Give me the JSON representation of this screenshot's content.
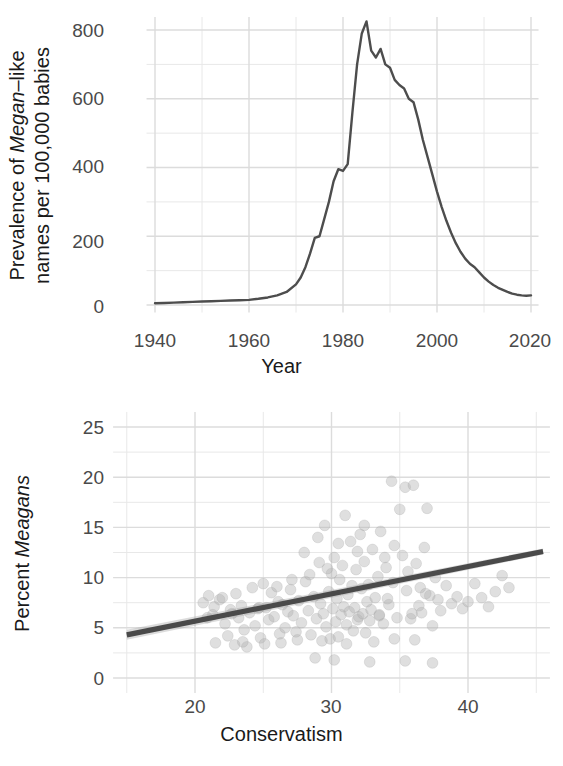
{
  "figure": {
    "background": "#ffffff",
    "grid_color": "#e8e8e8",
    "data_color": "#4d4d4d",
    "point_color": "#b3b3b3"
  },
  "chart_data": [
    {
      "type": "line",
      "panel": "top",
      "title": "",
      "xlabel": "Year",
      "ylabel": "Prevalence of Megan-like names per 100,000 babies",
      "ylabel_line1_pre": "Prevalence of ",
      "ylabel_line1_ital": "Megan",
      "ylabel_line1_post": "–like",
      "ylabel_line2": "names per 100,000 babies",
      "xlim": [
        1938,
        2022
      ],
      "ylim": [
        -20,
        840
      ],
      "xticks": [
        1940,
        1960,
        1980,
        2000,
        2020
      ],
      "xtick_labels": [
        "1940",
        "1960",
        "1980",
        "2000",
        "2020"
      ],
      "yticks": [
        0,
        200,
        400,
        600,
        800
      ],
      "ytick_labels": [
        "0",
        "200",
        "400",
        "600",
        "800"
      ],
      "grid": true,
      "minor_grid": true,
      "x": [
        1940,
        1942,
        1944,
        1946,
        1948,
        1950,
        1952,
        1954,
        1956,
        1958,
        1960,
        1962,
        1964,
        1966,
        1968,
        1970,
        1971,
        1972,
        1973,
        1974,
        1975,
        1976,
        1977,
        1978,
        1979,
        1980,
        1981,
        1982,
        1983,
        1984,
        1985,
        1986,
        1987,
        1988,
        1989,
        1990,
        1991,
        1992,
        1993,
        1994,
        1995,
        1996,
        1997,
        1998,
        1999,
        2000,
        2001,
        2002,
        2003,
        2004,
        2005,
        2006,
        2007,
        2008,
        2009,
        2010,
        2011,
        2012,
        2013,
        2014,
        2015,
        2016,
        2017,
        2018,
        2019,
        2020
      ],
      "y": [
        5,
        6,
        7,
        8,
        9,
        10,
        11,
        12,
        13,
        14,
        15,
        18,
        22,
        28,
        38,
        60,
        80,
        110,
        150,
        195,
        200,
        250,
        300,
        360,
        395,
        390,
        410,
        560,
        700,
        790,
        825,
        740,
        720,
        745,
        700,
        690,
        655,
        640,
        630,
        600,
        590,
        540,
        480,
        430,
        380,
        330,
        285,
        245,
        210,
        180,
        155,
        135,
        120,
        110,
        95,
        80,
        68,
        58,
        50,
        44,
        38,
        33,
        30,
        28,
        27,
        28
      ],
      "series_name": "Megan-like name prevalence"
    },
    {
      "type": "scatter",
      "panel": "bottom",
      "title": "",
      "xlabel": "Conservatism",
      "ylabel": "Percent Meagans",
      "ylabel_pre": "Percent ",
      "ylabel_ital": "Meagans",
      "xlim": [
        14,
        46
      ],
      "ylim": [
        -1.5,
        26.5
      ],
      "xticks": [
        20,
        30,
        40
      ],
      "xtick_labels": [
        "20",
        "30",
        "40"
      ],
      "yticks": [
        0,
        5,
        10,
        15,
        20,
        25
      ],
      "ytick_labels": [
        "0",
        "5",
        "10",
        "15",
        "20",
        "25"
      ],
      "grid": true,
      "minor_grid": true,
      "fit": {
        "type": "linear",
        "x_start": 15.0,
        "y_start": 4.3,
        "x_end": 45.5,
        "y_end": 12.6,
        "slope": 0.272,
        "intercept": 0.22,
        "band": true
      },
      "points": [
        [
          20.6,
          7.5
        ],
        [
          21.0,
          8.2
        ],
        [
          21.3,
          6.3
        ],
        [
          21.5,
          3.5
        ],
        [
          21.8,
          7.8
        ],
        [
          22.0,
          8.0
        ],
        [
          22.2,
          5.4
        ],
        [
          22.4,
          4.2
        ],
        [
          22.6,
          6.8
        ],
        [
          22.9,
          3.3
        ],
        [
          23.0,
          8.4
        ],
        [
          23.2,
          6.0
        ],
        [
          23.4,
          7.2
        ],
        [
          23.6,
          4.8
        ],
        [
          23.8,
          3.1
        ],
        [
          24.0,
          6.5
        ],
        [
          24.2,
          9.0
        ],
        [
          24.4,
          5.2
        ],
        [
          24.6,
          6.9
        ],
        [
          24.8,
          4.0
        ],
        [
          25.0,
          9.4
        ],
        [
          25.2,
          7.0
        ],
        [
          25.4,
          5.8
        ],
        [
          25.6,
          8.5
        ],
        [
          25.8,
          6.1
        ],
        [
          26.0,
          9.1
        ],
        [
          26.2,
          4.4
        ],
        [
          26.4,
          7.3
        ],
        [
          26.6,
          5.0
        ],
        [
          26.8,
          6.6
        ],
        [
          27.0,
          8.8
        ],
        [
          27.2,
          6.2
        ],
        [
          27.4,
          4.6
        ],
        [
          27.6,
          7.7
        ],
        [
          27.8,
          5.5
        ],
        [
          28.0,
          12.5
        ],
        [
          28.1,
          9.6
        ],
        [
          28.3,
          6.7
        ],
        [
          28.5,
          4.3
        ],
        [
          28.7,
          8.1
        ],
        [
          28.9,
          5.9
        ],
        [
          29.0,
          14.0
        ],
        [
          29.1,
          11.5
        ],
        [
          29.2,
          7.4
        ],
        [
          29.4,
          6.4
        ],
        [
          29.5,
          15.2
        ],
        [
          29.6,
          5.1
        ],
        [
          29.8,
          8.6
        ],
        [
          29.9,
          3.9
        ],
        [
          30.0,
          10.4
        ],
        [
          30.1,
          6.9
        ],
        [
          30.2,
          12.0
        ],
        [
          30.3,
          5.6
        ],
        [
          30.4,
          7.9
        ],
        [
          30.5,
          4.1
        ],
        [
          30.6,
          9.8
        ],
        [
          30.7,
          6.3
        ],
        [
          30.8,
          11.2
        ],
        [
          30.9,
          7.1
        ],
        [
          31.0,
          16.2
        ],
        [
          31.1,
          5.3
        ],
        [
          31.2,
          8.3
        ],
        [
          31.3,
          6.6
        ],
        [
          31.4,
          13.6
        ],
        [
          31.5,
          9.2
        ],
        [
          31.6,
          4.7
        ],
        [
          31.7,
          7.0
        ],
        [
          31.8,
          10.8
        ],
        [
          31.9,
          5.8
        ],
        [
          32.0,
          6.1
        ],
        [
          32.1,
          14.3
        ],
        [
          32.2,
          8.9
        ],
        [
          32.3,
          6.4
        ],
        [
          32.4,
          11.6
        ],
        [
          32.5,
          4.5
        ],
        [
          32.6,
          7.6
        ],
        [
          32.7,
          9.3
        ],
        [
          32.8,
          5.7
        ],
        [
          32.9,
          6.8
        ],
        [
          33.0,
          12.8
        ],
        [
          33.2,
          8.0
        ],
        [
          33.4,
          10.1
        ],
        [
          33.5,
          6.2
        ],
        [
          33.6,
          14.6
        ],
        [
          33.8,
          5.4
        ],
        [
          34.0,
          11.0
        ],
        [
          34.2,
          7.3
        ],
        [
          34.4,
          19.6
        ],
        [
          34.5,
          9.5
        ],
        [
          34.6,
          13.2
        ],
        [
          34.8,
          6.0
        ],
        [
          35.0,
          16.8
        ],
        [
          35.2,
          12.2
        ],
        [
          35.4,
          19.0
        ],
        [
          35.5,
          8.7
        ],
        [
          35.6,
          10.6
        ],
        [
          35.8,
          5.9
        ],
        [
          36.0,
          19.2
        ],
        [
          36.2,
          11.4
        ],
        [
          36.4,
          7.2
        ],
        [
          36.5,
          9.0
        ],
        [
          36.6,
          6.5
        ],
        [
          36.8,
          13.0
        ],
        [
          37.0,
          16.9
        ],
        [
          37.2,
          8.2
        ],
        [
          37.4,
          5.2
        ],
        [
          37.6,
          10.0
        ],
        [
          37.8,
          7.8
        ],
        [
          38.0,
          6.7
        ],
        [
          38.4,
          9.2
        ],
        [
          38.8,
          7.4
        ],
        [
          39.2,
          8.1
        ],
        [
          39.6,
          6.9
        ],
        [
          40.0,
          7.6
        ],
        [
          40.5,
          9.4
        ],
        [
          41.0,
          8.0
        ],
        [
          41.5,
          7.1
        ],
        [
          42.0,
          8.6
        ],
        [
          42.5,
          10.2
        ],
        [
          43.0,
          9.0
        ],
        [
          30.2,
          1.8
        ],
        [
          32.8,
          1.6
        ],
        [
          35.4,
          1.7
        ],
        [
          37.4,
          1.5
        ],
        [
          28.8,
          2.0
        ],
        [
          23.5,
          3.6
        ],
        [
          25.1,
          3.4
        ],
        [
          26.3,
          3.5
        ],
        [
          27.5,
          3.8
        ],
        [
          29.3,
          3.7
        ],
        [
          31.1,
          3.4
        ],
        [
          33.1,
          3.6
        ],
        [
          34.6,
          3.9
        ],
        [
          36.1,
          3.8
        ],
        [
          33.5,
          6.3
        ],
        [
          34.1,
          7.9
        ],
        [
          35.9,
          6.4
        ],
        [
          36.9,
          8.4
        ],
        [
          30.5,
          13.4
        ],
        [
          31.9,
          12.6
        ],
        [
          29.7,
          10.9
        ],
        [
          28.4,
          10.3
        ],
        [
          27.1,
          9.8
        ],
        [
          26.1,
          7.6
        ],
        [
          24.7,
          7.0
        ],
        [
          22.7,
          6.4
        ],
        [
          21.4,
          7.1
        ],
        [
          20.9,
          6.0
        ],
        [
          32.4,
          15.2
        ],
        [
          33.9,
          12.0
        ]
      ]
    }
  ]
}
